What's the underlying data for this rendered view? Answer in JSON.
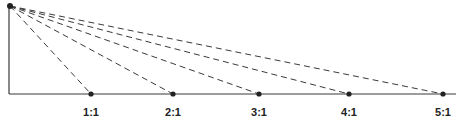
{
  "diagram": {
    "origin": {
      "x": 10,
      "y": 6
    },
    "axis": {
      "x0": 9,
      "y_top": 6,
      "y_base": 94,
      "x_end": 456
    },
    "stroke_color": "#3a3a3a",
    "points": [
      {
        "label": "1:1",
        "x": 91
      },
      {
        "label": "2:1",
        "x": 173
      },
      {
        "label": "3:1",
        "x": 259
      },
      {
        "label": "4:1",
        "x": 349
      },
      {
        "label": "5:1",
        "x": 443
      }
    ]
  }
}
